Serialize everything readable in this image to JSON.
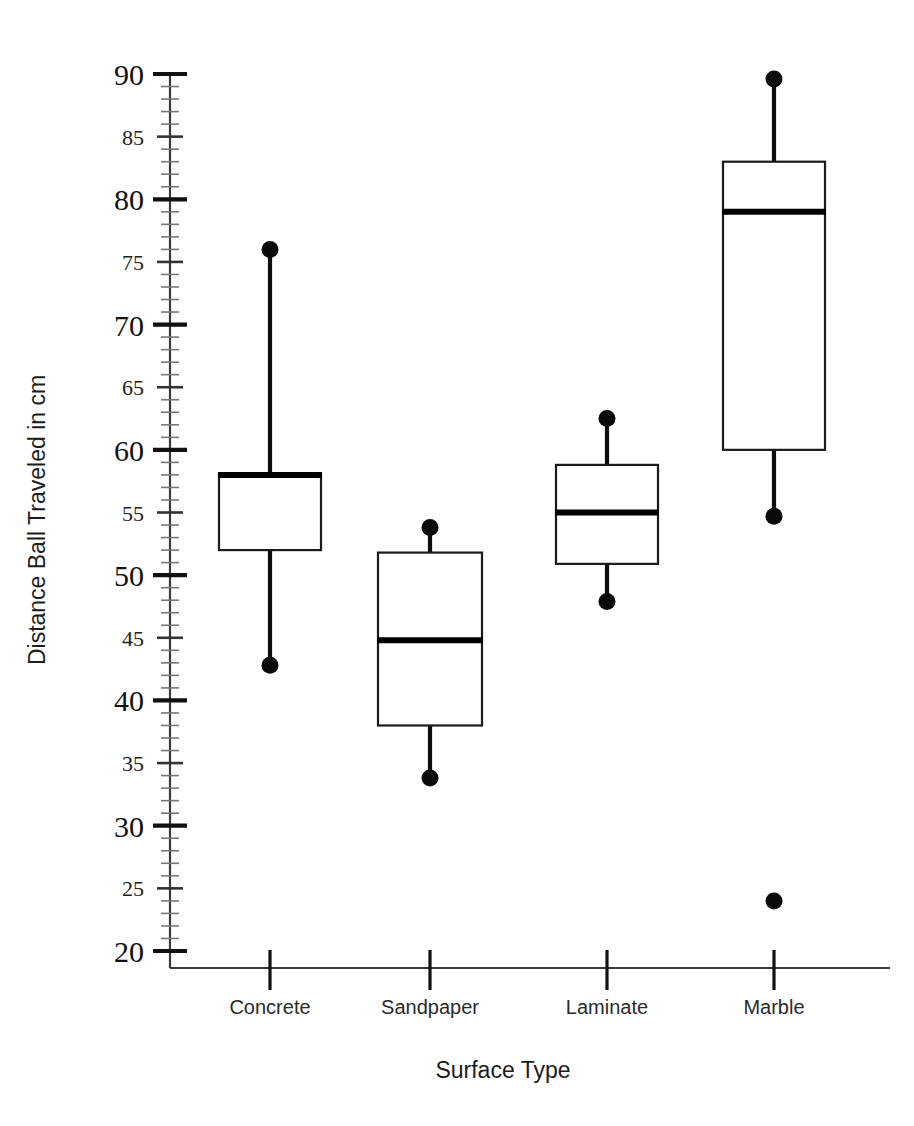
{
  "chart_data": {
    "type": "box",
    "title": "",
    "xlabel": "Surface Type",
    "ylabel": "Distance Ball Traveled in cm",
    "categories": [
      "Concrete",
      "Sandpaper",
      "Laminate",
      "Marble"
    ],
    "ylim": [
      20,
      90
    ],
    "y_major_step": 10,
    "y_label_step": 5,
    "y_minor_step": 1,
    "y_tick_labels": [
      "20",
      "25",
      "30",
      "35",
      "40",
      "45",
      "50",
      "55",
      "60",
      "65",
      "70",
      "75",
      "80",
      "85",
      "90"
    ],
    "grid": false,
    "legend": "none",
    "boxes": [
      {
        "category": "Concrete",
        "min": 42.8,
        "q1": 52,
        "median": 58,
        "q3": 58,
        "max": 76,
        "outliers": []
      },
      {
        "category": "Sandpaper",
        "min": 33.8,
        "q1": 38,
        "median": 44.8,
        "q3": 51.8,
        "max": 53.8,
        "outliers": []
      },
      {
        "category": "Laminate",
        "min": 47.9,
        "q1": 50.9,
        "median": 55,
        "q3": 58.8,
        "max": 62.5,
        "outliers": []
      },
      {
        "category": "Marble",
        "min": 54.7,
        "q1": 60,
        "median": 79,
        "q3": 83,
        "max": 89.6,
        "outliers": [
          24
        ]
      }
    ]
  },
  "colors": {
    "background": "#ffffff",
    "ink": "#111111",
    "box_fill": "#ffffff",
    "box_stroke": "#1a1a1a",
    "whisker": "#0d0d0d",
    "minor_tick": "#777777"
  }
}
